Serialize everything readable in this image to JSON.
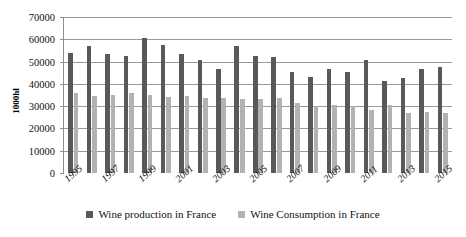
{
  "chart_data": {
    "type": "bar",
    "title": "",
    "xlabel": "",
    "ylabel": "1000hl",
    "ylim": [
      0,
      70000
    ],
    "ytick_step": 10000,
    "yticks": [
      "0",
      "10000",
      "20000",
      "30000",
      "40000",
      "50000",
      "60000",
      "70000"
    ],
    "grid": true,
    "legend_position": "bottom",
    "categories": [
      "1995",
      "1996",
      "1997",
      "1998",
      "1999",
      "2000",
      "2001",
      "2002",
      "2003",
      "2004",
      "2005",
      "2006",
      "2007",
      "2008",
      "2009",
      "2010",
      "2011",
      "2012",
      "2013",
      "2014",
      "2015"
    ],
    "xtick_labels_shown": [
      "1995",
      "1997",
      "1999",
      "2001",
      "2003",
      "2005",
      "2007",
      "2009",
      "2011",
      "2013",
      "2015"
    ],
    "series": [
      {
        "name": "Wine production in France",
        "color": "#595959",
        "values": [
          54000,
          57000,
          53500,
          52500,
          60500,
          57500,
          53500,
          50500,
          46500,
          57000,
          52500,
          52000,
          45500,
          43000,
          46500,
          45500,
          50500,
          41500,
          42500,
          46500,
          47500
        ]
      },
      {
        "name": "Wine Consumption in France",
        "color": "#b2b2b2",
        "values": [
          36000,
          34500,
          35000,
          36000,
          35000,
          34000,
          34500,
          33500,
          33500,
          33000,
          33000,
          33500,
          31500,
          30000,
          30500,
          30000,
          28500,
          30500,
          27000,
          27500,
          27000
        ]
      }
    ]
  },
  "legend": {
    "items": [
      {
        "label": "Wine production in France",
        "color": "#595959"
      },
      {
        "label": "Wine Consumption in France",
        "color": "#b2b2b2"
      }
    ]
  }
}
